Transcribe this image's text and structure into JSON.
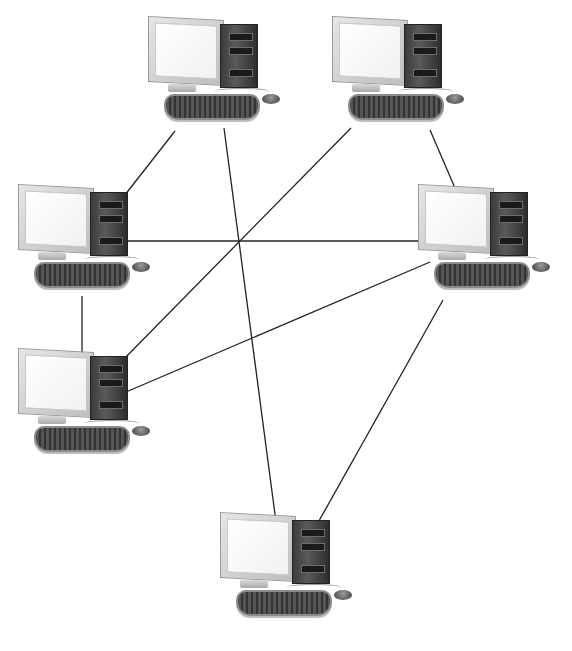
{
  "diagram": {
    "type": "network-topology",
    "node_icon": "desktop-computer-icon",
    "link_color": "#222222",
    "nodes": [
      {
        "id": "pc1",
        "label": "",
        "x": 148,
        "y": 18
      },
      {
        "id": "pc2",
        "label": "",
        "x": 332,
        "y": 18
      },
      {
        "id": "pc3",
        "label": "",
        "x": 18,
        "y": 186
      },
      {
        "id": "pc4",
        "label": "",
        "x": 18,
        "y": 350
      },
      {
        "id": "pc5",
        "label": "",
        "x": 418,
        "y": 186
      },
      {
        "id": "pc6",
        "label": "",
        "x": 220,
        "y": 514
      }
    ],
    "links": [
      {
        "from": "pc1",
        "to": "pc3",
        "x1": 175,
        "y1": 131,
        "x2": 121,
        "y2": 200
      },
      {
        "from": "pc1",
        "to": "pc6",
        "x1": 224,
        "y1": 128,
        "x2": 276,
        "y2": 522
      },
      {
        "from": "pc2",
        "to": "pc4",
        "x1": 351,
        "y1": 128,
        "x2": 121,
        "y2": 362
      },
      {
        "from": "pc2",
        "to": "pc5",
        "x1": 430,
        "y1": 130,
        "x2": 458,
        "y2": 195
      },
      {
        "from": "pc3",
        "to": "pc5",
        "x1": 126,
        "y1": 241,
        "x2": 418,
        "y2": 241
      },
      {
        "from": "pc3",
        "to": "pc4",
        "x1": 82,
        "y1": 296,
        "x2": 82,
        "y2": 355
      },
      {
        "from": "pc5",
        "to": "pc4",
        "x1": 430,
        "y1": 262,
        "x2": 126,
        "y2": 392
      },
      {
        "from": "pc5",
        "to": "pc6",
        "x1": 443,
        "y1": 300,
        "x2": 315,
        "y2": 528
      }
    ]
  },
  "caption": {
    "text": ""
  }
}
